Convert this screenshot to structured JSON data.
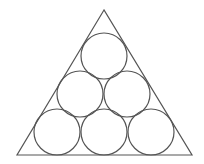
{
  "diagram": {
    "stroke_color": "#555555",
    "background": "#ffffff",
    "triangle": {
      "points": [
        [
          104,
          10
        ],
        [
          17,
          155
        ],
        [
          192,
          155
        ]
      ]
    },
    "circle_radius": 23,
    "circles": [
      {
        "row": 1,
        "cx": 104,
        "cy": 56
      },
      {
        "row": 2,
        "cx": 80,
        "cy": 94
      },
      {
        "row": 2,
        "cx": 127,
        "cy": 94
      },
      {
        "row": 3,
        "cx": 57,
        "cy": 132
      },
      {
        "row": 3,
        "cx": 104,
        "cy": 132
      },
      {
        "row": 3,
        "cx": 151,
        "cy": 132
      }
    ]
  }
}
